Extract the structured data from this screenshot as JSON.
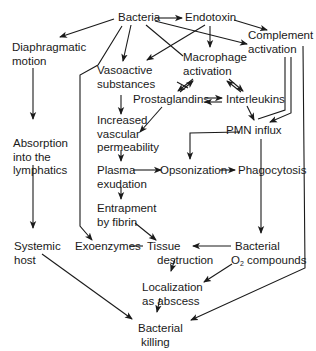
{
  "diagram": {
    "nodes": {
      "bacteria": {
        "lines": [
          "Bacteria"
        ]
      },
      "endotoxin": {
        "lines": [
          "Endotoxin"
        ]
      },
      "complement": {
        "lines": [
          "Complement",
          "activation"
        ]
      },
      "diaphragmatic": {
        "lines": [
          "Diaphragmatic",
          "motion"
        ]
      },
      "vasoactive": {
        "lines": [
          "Vasoactive",
          "substances"
        ]
      },
      "macrophage": {
        "lines": [
          "Macrophage",
          "activation"
        ]
      },
      "prostaglandins": {
        "lines": [
          "Prostaglandins"
        ]
      },
      "interleukins": {
        "lines": [
          "Interleukins"
        ]
      },
      "increased": {
        "lines": [
          "Increased",
          "vascular",
          "permeability"
        ]
      },
      "pmn": {
        "lines": [
          "PMN influx"
        ]
      },
      "absorption": {
        "lines": [
          "Absorption",
          "into the",
          "lymphatics"
        ]
      },
      "plasma": {
        "lines": [
          "Plasma",
          "exudation"
        ]
      },
      "opsonization": {
        "lines": [
          "Opsonization"
        ]
      },
      "phagocytosis": {
        "lines": [
          "Phagocytosis"
        ]
      },
      "entrapment": {
        "lines": [
          "Entrapment",
          "by fibrin"
        ]
      },
      "systemic": {
        "lines": [
          "Systemic",
          "host"
        ]
      },
      "exoenzymes": {
        "lines": [
          "Exoenzymes"
        ]
      },
      "tissue": {
        "lines": [
          "Tissue",
          "destruction"
        ]
      },
      "bacterial_o2": {
        "lines": [
          "Bacterial",
          "O",
          "2",
          " compounds"
        ]
      },
      "localization": {
        "lines": [
          "Localization",
          "as abscess"
        ]
      },
      "killing": {
        "lines": [
          "Bacterial",
          "killing"
        ]
      }
    },
    "edges": [
      {
        "from": "Bacteria",
        "to": "Endotoxin"
      },
      {
        "from": "Bacteria",
        "to": "Diaphragmatic motion"
      },
      {
        "from": "Bacteria",
        "to": "Vasoactive substances"
      },
      {
        "from": "Bacteria",
        "to": "Macrophage activation"
      },
      {
        "from": "Bacteria",
        "to": "Complement activation"
      },
      {
        "from": "Bacteria",
        "to": "Exoenzymes"
      },
      {
        "from": "Endotoxin",
        "to": "Complement activation"
      },
      {
        "from": "Endotoxin",
        "to": "Macrophage activation"
      },
      {
        "from": "Endotoxin",
        "to": "Vasoactive substances"
      },
      {
        "from": "Macrophage activation",
        "to": "Prostaglandins",
        "bidirectional": true
      },
      {
        "from": "Macrophage activation",
        "to": "Interleukins",
        "bidirectional": true
      },
      {
        "from": "Prostaglandins",
        "to": "Interleukins",
        "bidirectional": true
      },
      {
        "from": "Prostaglandins",
        "to": "Increased vascular permeability"
      },
      {
        "from": "Vasoactive substances",
        "to": "Increased vascular permeability"
      },
      {
        "from": "Interleukins",
        "to": "PMN influx"
      },
      {
        "from": "Complement activation",
        "to": "PMN influx"
      },
      {
        "from": "Complement activation",
        "to": "Bacterial killing"
      },
      {
        "from": "PMN influx",
        "to": "Opsonization"
      },
      {
        "from": "PMN influx",
        "to": "Bacterial O2 compounds"
      },
      {
        "from": "Diaphragmatic motion",
        "to": "Absorption into the lymphatics"
      },
      {
        "from": "Absorption into the lymphatics",
        "to": "Systemic host"
      },
      {
        "from": "Systemic host",
        "to": "Bacterial killing"
      },
      {
        "from": "Increased vascular permeability",
        "to": "Plasma exudation"
      },
      {
        "from": "Plasma exudation",
        "to": "Opsonization"
      },
      {
        "from": "Opsonization",
        "to": "Phagocytosis"
      },
      {
        "from": "Plasma exudation",
        "to": "Entrapment by fibrin"
      },
      {
        "from": "Entrapment by fibrin",
        "to": "Tissue destruction"
      },
      {
        "from": "Exoenzymes",
        "to": "Tissue destruction"
      },
      {
        "from": "Bacterial O2 compounds",
        "to": "Tissue destruction"
      },
      {
        "from": "Bacterial O2 compounds",
        "to": "Localization as abscess"
      },
      {
        "from": "Tissue destruction",
        "to": "Localization as abscess"
      },
      {
        "from": "Localization as abscess",
        "to": "Bacterial killing"
      }
    ]
  }
}
